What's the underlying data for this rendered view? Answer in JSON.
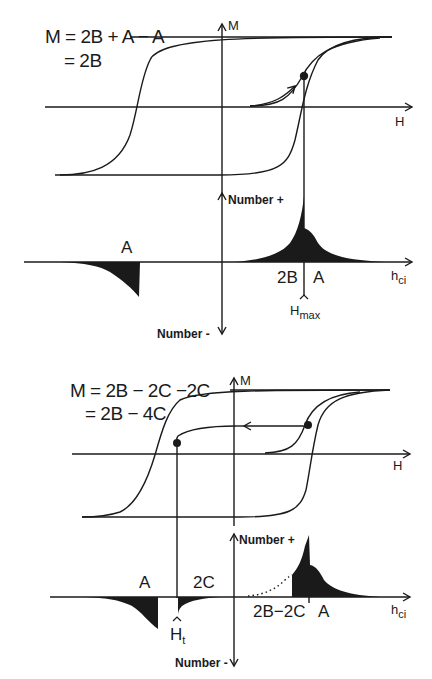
{
  "panels": [
    {
      "id": "top",
      "equation": {
        "line1": "M = 2B + A − A",
        "line2": "= 2B"
      },
      "loop_axes": {
        "y_label": "M",
        "x_label": "H"
      },
      "distribution_axes": {
        "y_pos_label": "Number +",
        "y_neg_label": "Number -",
        "x_label": "h",
        "x_label_sub": "ci"
      },
      "region_labels": {
        "neg_peak": "A",
        "pos_left": "2B",
        "pos_right": "A"
      },
      "marker": {
        "label": "H",
        "sub": "max"
      }
    },
    {
      "id": "bottom",
      "equation": {
        "line1": "M = 2B − 2C −2C",
        "line2": "= 2B − 4C"
      },
      "loop_axes": {
        "y_label": "M",
        "x_label": "H"
      },
      "distribution_axes": {
        "y_pos_label": "Number +",
        "y_neg_label": "Number -",
        "x_label": "h",
        "x_label_sub": "ci"
      },
      "region_labels": {
        "neg_peak": "A",
        "neg_small": "2C",
        "pos_left": "2B−2C",
        "pos_right": "A"
      },
      "marker": {
        "label": "H",
        "sub": "t"
      }
    }
  ],
  "colors": {
    "ink": "#1a1a1a",
    "background": "#ffffff"
  }
}
